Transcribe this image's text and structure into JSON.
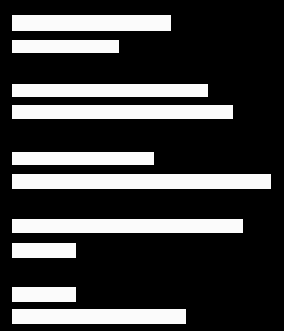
{
  "chart_data": {
    "type": "bar",
    "orientation": "horizontal",
    "title": "",
    "subtitle": "",
    "xlabel": "",
    "ylabel": "",
    "grid": false,
    "legend": null,
    "legend_position": "none",
    "axis_visible": false,
    "tick_labels_visible": false,
    "categories": [
      "bar-1",
      "bar-2",
      "bar-3",
      "bar-4",
      "bar-5",
      "bar-6",
      "bar-7",
      "bar-8",
      "bar-9",
      "bar-10"
    ],
    "values": [
      159,
      107,
      196,
      221,
      142,
      259,
      231,
      64,
      64,
      174
    ],
    "xlim": [
      0,
      272
    ],
    "ylim": [
      0,
      331
    ],
    "value_units": "px",
    "bar_color": "#fbfbfb",
    "background_color": "#000000",
    "bar_origin_x": 12,
    "bars": [
      {
        "index": 1,
        "value": 159,
        "x": 12,
        "y": 15,
        "width": 159,
        "height": 16
      },
      {
        "index": 2,
        "value": 107,
        "x": 12,
        "y": 40,
        "width": 107,
        "height": 13
      },
      {
        "index": 3,
        "value": 196,
        "x": 12,
        "y": 84,
        "width": 196,
        "height": 13
      },
      {
        "index": 4,
        "value": 221,
        "x": 12,
        "y": 105,
        "width": 221,
        "height": 14
      },
      {
        "index": 5,
        "value": 142,
        "x": 12,
        "y": 152,
        "width": 142,
        "height": 13
      },
      {
        "index": 6,
        "value": 259,
        "x": 12,
        "y": 174,
        "width": 259,
        "height": 15
      },
      {
        "index": 7,
        "value": 231,
        "x": 12,
        "y": 219,
        "width": 231,
        "height": 14
      },
      {
        "index": 8,
        "value": 64,
        "x": 12,
        "y": 243,
        "width": 64,
        "height": 15
      },
      {
        "index": 9,
        "value": 64,
        "x": 12,
        "y": 287,
        "width": 64,
        "height": 15
      },
      {
        "index": 10,
        "value": 174,
        "x": 12,
        "y": 309,
        "width": 174,
        "height": 15
      }
    ]
  }
}
